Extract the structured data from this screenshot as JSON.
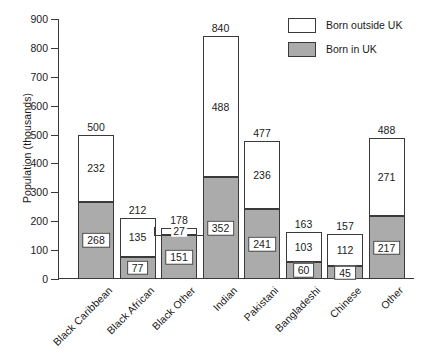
{
  "chart_data": {
    "type": "bar",
    "stacked": true,
    "title": "",
    "xlabel": "",
    "ylabel": "Population (thousands)",
    "ylim": [
      0,
      900
    ],
    "ytick_step": 100,
    "yticks": [
      "900",
      "800",
      "700",
      "600",
      "500",
      "400",
      "300",
      "200",
      "100",
      "0"
    ],
    "grid": false,
    "legend_position": "top-right",
    "categories": [
      "Black Caribbean",
      "Black African",
      "Black Other",
      "Indian",
      "Pakistani",
      "Bangladeshi",
      "Chinese",
      "Other"
    ],
    "series": [
      {
        "name": "Born outside UK",
        "color": "#ffffff",
        "values": [
          232,
          135,
          27,
          488,
          236,
          103,
          112,
          271
        ]
      },
      {
        "name": "Born in UK",
        "color": "#ababab",
        "values": [
          268,
          77,
          151,
          352,
          241,
          60,
          45,
          217
        ]
      }
    ],
    "totals": [
      500,
      212,
      178,
      840,
      477,
      163,
      157,
      488
    ],
    "annotations": {
      "note": "Each bar is annotated with its total above the bar; each stacked segment is annotated with its own value."
    }
  },
  "legend": {
    "items": [
      {
        "label": "Born outside UK",
        "color": "#ffffff"
      },
      {
        "label": "Born in UK",
        "color": "#ababab"
      }
    ]
  },
  "colors": {
    "born_in_uk": "#ababab",
    "born_outside_uk": "#ffffff",
    "axis": "#3a3a3a",
    "text": "#1a1a1a",
    "background": "#ffffff"
  }
}
